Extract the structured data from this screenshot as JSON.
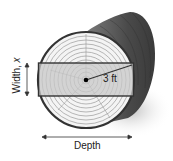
{
  "diagram": {
    "labels": {
      "radius": "3 ft",
      "depth": "Depth",
      "width_text": "Width, ",
      "width_var": "x"
    },
    "colors": {
      "log_bark": "#5a5a5a",
      "log_face": "#f4f4f4",
      "rings": "#9a9a9a",
      "beam_fill": "#c8c8c8",
      "outline": "#333333",
      "shadow": "#d8d8d8"
    }
  }
}
